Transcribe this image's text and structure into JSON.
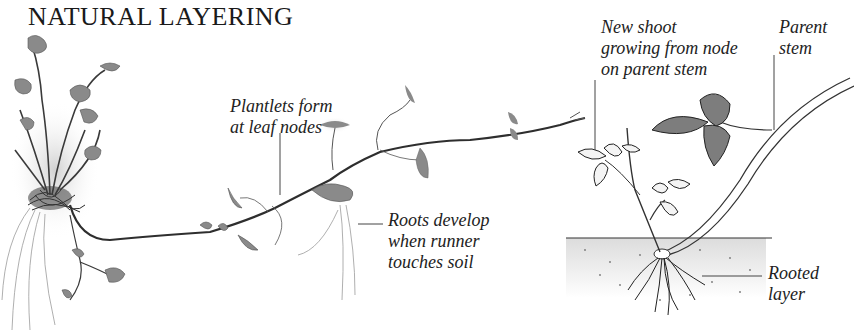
{
  "title": "NATURAL LAYERING",
  "labels": {
    "plantlets": "Plantlets form\nat leaf nodes",
    "roots": "Roots develop\nwhen runner\ntouches soil",
    "new_shoot": "New shoot\ngrowing from node\non parent stem",
    "parent_stem": "Parent\nstem",
    "rooted_layer": "Rooted\nlayer"
  },
  "illustrations": {
    "left": "Strawberry-type parent plant with runner producing plantlets at leaf nodes and rooting where it touches soil",
    "right": "Bramble cane arching down to soil, rooted at tip with new shoot growing from node"
  },
  "colors": {
    "text": "#222222",
    "ink": "#333333",
    "foliage": "#8a8a8a",
    "soil": "#e6e6e6"
  }
}
